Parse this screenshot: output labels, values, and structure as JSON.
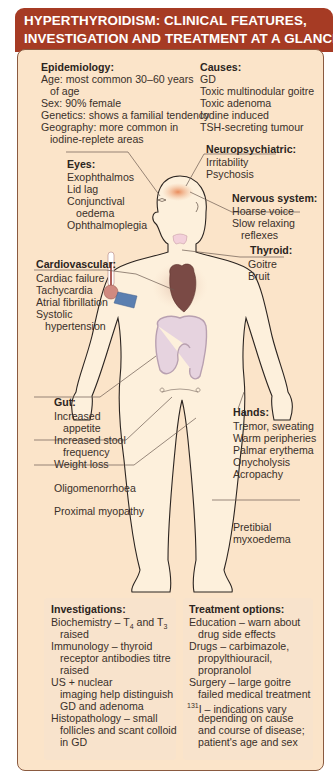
{
  "title": {
    "line1": "HYPERTHYROIDISM: CLINICAL FEATURES,",
    "line2": "INVESTIGATION AND TREATMENT AT A GLANCE"
  },
  "colors": {
    "header_bg": "#a63b24",
    "panel_bg": "#fbe4c9",
    "panel_border": "#8a5a40",
    "skin": "#fdf0dc",
    "heart": "#7a4a45",
    "gut": "#e6d3df",
    "thyroid": "#f3d0da",
    "cuff": "#5b7fb0",
    "brain_hotspot": "#e88a55"
  },
  "epidemiology": {
    "heading": "Epidemiology:",
    "lines": [
      "Age: most common 30–60 years",
      "of age",
      "Sex: 90% female",
      "Genetics: shows a familial tendency",
      "Geography: more common in",
      "iodine-replete areas"
    ]
  },
  "causes": {
    "heading": "Causes:",
    "items": [
      "GD",
      "Toxic multinodular goitre",
      "Toxic adenoma",
      "Iodine induced",
      "TSH-secreting tumour"
    ]
  },
  "neuropsychiatric": {
    "heading": "Neuropsychiatric:",
    "items": [
      "Irritability",
      "Psychosis"
    ]
  },
  "eyes": {
    "heading": "Eyes:",
    "items": [
      "Exophthalmos",
      "Lid lag",
      "Conjunctival",
      "oedema",
      "Ophthalmoplegia"
    ]
  },
  "nervous_system": {
    "heading": "Nervous system:",
    "items": [
      "Hoarse voice",
      "Slow relaxing",
      "reflexes"
    ]
  },
  "thyroid": {
    "heading": "Thyroid:",
    "items": [
      "Goitre",
      "Bruit"
    ]
  },
  "cardiovascular": {
    "heading": "Cardiovascular:",
    "items": [
      "Cardiac failure",
      "Tachycardia",
      "Atrial fibrillation",
      "Systolic",
      "hypertension"
    ]
  },
  "gut": {
    "heading": "Gut:",
    "items": [
      "Increased",
      "appetite",
      "Increased stool",
      "frequency",
      "Weight loss"
    ]
  },
  "hands": {
    "heading": "Hands:",
    "items": [
      "Tremor, sweating",
      "Warm peripheries",
      "Palmar erythema",
      "Onycholysis",
      "Acropachy"
    ]
  },
  "standalone": {
    "oligomenorrhoea": "Oligomenorrhoea",
    "proximal_myopathy": "Proximal myopathy",
    "pretibial_1": "Pretibial",
    "pretibial_2": "myxoedema"
  },
  "investigations": {
    "heading": "Investigations:",
    "biochem_a": "Biochemistry – T",
    "biochem_sub1": "4",
    "biochem_b": " and T",
    "biochem_sub2": "3",
    "lines": [
      "raised",
      "Immunology – thyroid",
      "receptor antibodies titre",
      "raised",
      "US + nuclear",
      "imaging help distinguish",
      "GD and adenoma",
      "Histopathology – small",
      "follicles and scant colloid",
      "in GD"
    ]
  },
  "treatment": {
    "heading": "Treatment options:",
    "lines": [
      "Education – warn about",
      "drug side effects",
      "Drugs – carbimazole,",
      "propylthiouracil,",
      "propranolol",
      "Surgery – large goitre",
      "failed medical treatment"
    ],
    "iodine_sup": "131",
    "iodine_text": "I – indications vary",
    "iodine_lines": [
      "depending on cause",
      "and course of disease;",
      "patient's age and sex"
    ]
  }
}
